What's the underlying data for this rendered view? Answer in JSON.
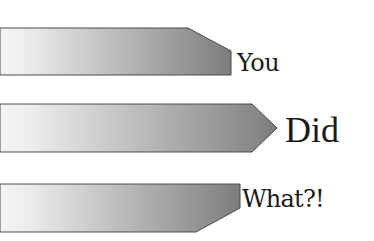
{
  "diagram": {
    "type": "arrow-bars",
    "colors": {
      "gradient_start": "#f4f4f4",
      "gradient_end": "#7d7d7d",
      "outline": "#4a4a4a",
      "text": "#1a1a1a",
      "background": "#ffffff"
    },
    "bars": [
      {
        "label": "You",
        "shape": "top-right-chamfer",
        "points": "0,28 188,28 231,51 231,75 0,75"
      },
      {
        "label": "Did",
        "shape": "chevron-point",
        "points": "0,104 252,104 277,128 252,152 0,152"
      },
      {
        "label": "What?!",
        "shape": "bottom-right-chamfer",
        "points": "0,184 240,184 240,208 196,232 0,232"
      }
    ]
  }
}
